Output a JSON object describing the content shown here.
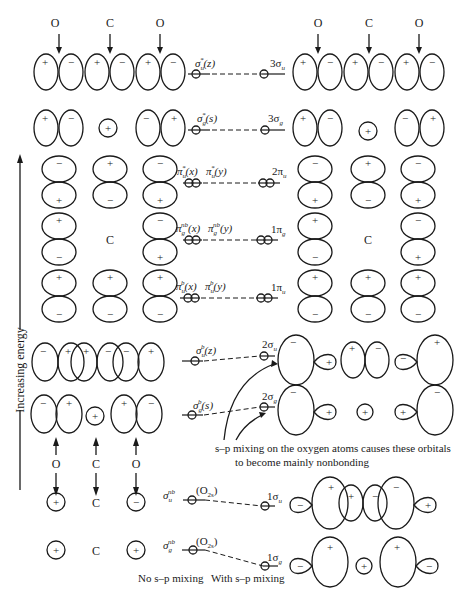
{
  "figure": {
    "axis_label": "Increasing energy",
    "atoms_top": [
      "O",
      "C",
      "O"
    ],
    "atoms_bottom": [
      "O",
      "C",
      "O"
    ],
    "center_atom_label": "C",
    "column_captions": {
      "left": "No s–p mixing",
      "right": "With s–p mixing"
    },
    "annotation": {
      "line1": "s–p mixing on the oxygen atoms causes these orbitals",
      "line2": "to become mainly nonbonding"
    }
  },
  "levels": [
    {
      "id": "3su",
      "left_label": "σu*(z)",
      "right_label": "3σu",
      "electrons": 0
    },
    {
      "id": "3sg",
      "left_label": "σg*(s)",
      "right_label": "3σg",
      "electrons": 0
    },
    {
      "id": "2pu",
      "left_label": "πu*(x)  πu*(y)",
      "right_label": "2πu",
      "electrons": 0
    },
    {
      "id": "1pg",
      "left_label": "πg^nb(x)  πg^nb(y)",
      "right_label": "1πg",
      "electrons": 4
    },
    {
      "id": "1pu",
      "left_label": "πu^b(x)  πu^b(y)",
      "right_label": "1πu",
      "electrons": 4
    },
    {
      "id": "2su",
      "left_label": "σu^b(z)",
      "right_label": "2σu",
      "electrons": 2
    },
    {
      "id": "2sg",
      "left_label": "σg^b(s)",
      "right_label": "2σg",
      "electrons": 2
    },
    {
      "id": "1su",
      "left_label": "σu^nb",
      "left_sub": "(O2s)",
      "right_label": "1σu",
      "electrons": 2
    },
    {
      "id": "1sg",
      "left_label": "σg^nb",
      "left_sub": "(O2s)",
      "right_label": "1σg",
      "electrons": 2
    }
  ],
  "labels": {
    "sigma": "σ",
    "pi": "π",
    "u": "u",
    "g": "g",
    "star": "*",
    "b": "b",
    "nb": "nb",
    "x": "(x)",
    "y": "(y)",
    "z": "(z)",
    "s": "(s)",
    "n3su": "3σ",
    "n3sg": "3σ",
    "n2pu": "2π",
    "n1pg": "1π",
    "n1pu": "1π",
    "n2su": "2σ",
    "n2sg": "2σ",
    "n1su": "1σ",
    "n1sg": "1σ",
    "o2s": "(O",
    "o2s_sub": "2s",
    "o2s_close": ")",
    "plus": "+",
    "minus": "−"
  }
}
